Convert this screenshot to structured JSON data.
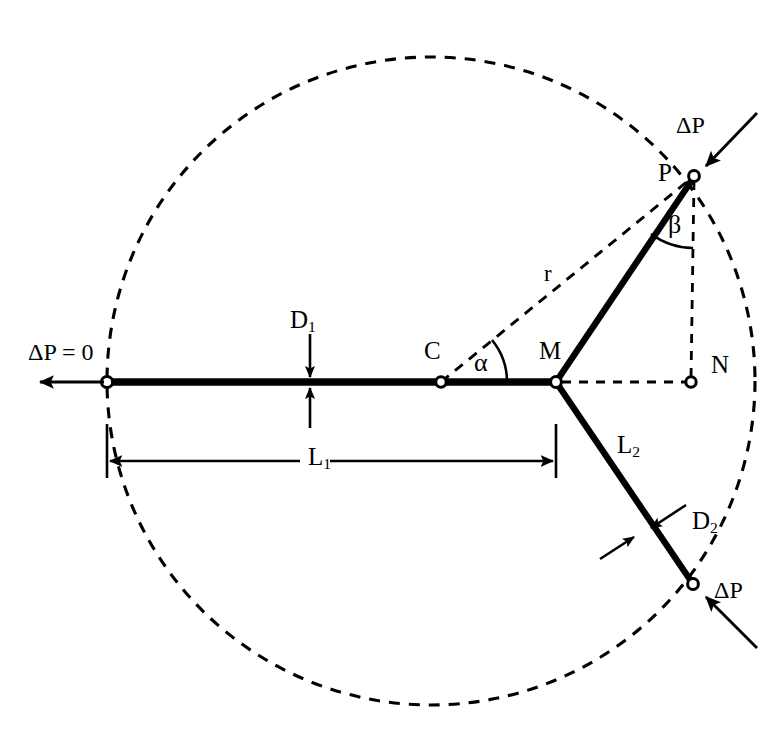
{
  "figure": {
    "type": "technical-line-diagram",
    "background_color": "#ffffff",
    "stroke_color": "#000000",
    "canvas": {
      "width": 783,
      "height": 743
    }
  },
  "labels": {
    "delta_p_zero": "ΔP = 0",
    "delta_p_top": "ΔP",
    "delta_p_bottom": "ΔP",
    "point_p": "P",
    "point_c": "C",
    "point_m": "M",
    "point_n": "N",
    "radius_r": "r",
    "angle_alpha": "α",
    "angle_beta": "β",
    "diameter_1_base": "D",
    "diameter_1_sub": "1",
    "diameter_2_base": "D",
    "diameter_2_sub": "2",
    "length_1_base": "L",
    "length_1_sub": "1",
    "length_2_base": "L",
    "length_2_sub": "2"
  },
  "geometry": {
    "circle": {
      "cx": 431,
      "cy": 381,
      "r": 324,
      "style": "dashed"
    },
    "points": {
      "inlet_left": {
        "x": 107,
        "y": 382
      },
      "C": {
        "x": 441,
        "y": 382
      },
      "M": {
        "x": 556,
        "y": 382
      },
      "P": {
        "x": 694,
        "y": 176
      },
      "N": {
        "x": 691,
        "y": 382
      },
      "outlet_lower": {
        "x": 693,
        "y": 584
      }
    },
    "segments": {
      "parent_vessel_L1": {
        "from": "inlet_left",
        "to": "M",
        "width": 7
      },
      "daughter_upper": {
        "from": "M",
        "to": "P",
        "width": 6
      },
      "daughter_lower_L2": {
        "from": "M",
        "to": "outlet_lower",
        "width": 6
      }
    },
    "dashed_construction": [
      {
        "name": "radius-C-to-P",
        "from": "C",
        "to": "P"
      },
      {
        "name": "vertical-P-to-N",
        "from": "P",
        "to": "N"
      },
      {
        "name": "horizontal-M-to-N",
        "from": "M",
        "to": "N"
      }
    ],
    "dimension_lines": {
      "L1": {
        "x_start": 107,
        "x_end": 556,
        "y": 461
      }
    },
    "angles": {
      "alpha": {
        "vertex": "C",
        "between": [
          "horizontal-axis",
          "radius-C-to-P"
        ],
        "arc_radius": 66
      },
      "beta": {
        "vertex": "P",
        "between": [
          "segment-P-M",
          "vertical-P-N"
        ],
        "arc_radius": 72
      }
    }
  },
  "label_positions": {
    "delta_p_zero": {
      "x": 28,
      "y": 340
    },
    "delta_p_top": {
      "x": 676,
      "y": 113
    },
    "delta_p_bottom": {
      "x": 714,
      "y": 578
    },
    "point_p": {
      "x": 658,
      "y": 160
    },
    "point_c": {
      "x": 424,
      "y": 338
    },
    "point_m": {
      "x": 539,
      "y": 338
    },
    "point_n": {
      "x": 711,
      "y": 352
    },
    "radius_r": {
      "x": 544,
      "y": 262
    },
    "angle_alpha": {
      "x": 474,
      "y": 350
    },
    "angle_beta": {
      "x": 668,
      "y": 212
    },
    "diameter_1": {
      "x": 290,
      "y": 307
    },
    "diameter_2": {
      "x": 692,
      "y": 508
    },
    "length_1": {
      "x": 308,
      "y": 444
    },
    "length_2": {
      "x": 617,
      "y": 432
    }
  }
}
